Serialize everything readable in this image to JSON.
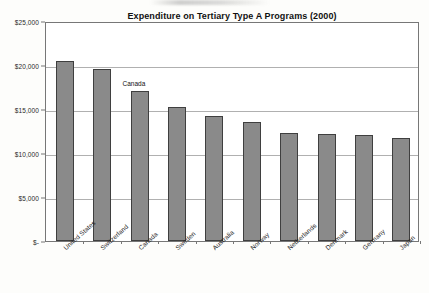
{
  "chart_data": {
    "type": "bar",
    "title": "Expenditure on Tertiary Type A Programs (2000)",
    "subtitle_line1": "Annual expenditure on educational institutions per student",
    "subtitle_line2": "in equivalent US dollars converted for PPPs",
    "xlabel": "",
    "ylabel": "",
    "categories": [
      "United States",
      "Switzerland",
      "Canada",
      "Sweden",
      "Australia",
      "Norway",
      "Netherlands",
      "Denmark",
      "Germany",
      "Japan"
    ],
    "values": [
      20400,
      19600,
      17000,
      15200,
      14200,
      13500,
      12300,
      12200,
      12100,
      11700
    ],
    "ylim": [
      0,
      25000
    ],
    "ytick_values": [
      25000,
      20000,
      15000,
      10000,
      5000,
      0
    ],
    "ytick_labels": [
      "$25,000",
      "$20,000",
      "$15,000",
      "$10,000",
      "$5,000",
      "$-"
    ],
    "grid": true,
    "legend": false,
    "annotations": [
      {
        "text": "Canada",
        "category": "Canada",
        "value": 17000
      }
    ],
    "colors": {
      "bar_fill": "#8a8a8a",
      "bar_border": "#3f3f3f",
      "gridline": "#b0b0b0",
      "plot_border": "#777777",
      "plot_background": "#ffffff",
      "page_background": "#fdfdfb",
      "text": "#111111"
    }
  }
}
